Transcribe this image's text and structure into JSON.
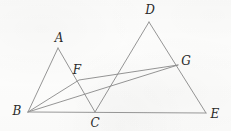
{
  "figure": {
    "stroke_color": "#8a8a8a",
    "baseline_color": "#9a9a9a",
    "label_color": "#2a2a2a",
    "background_color": "#fdfdfc",
    "width": 231,
    "height": 131,
    "points": [
      {
        "id": "A",
        "label": "A",
        "x": 58,
        "y": 48,
        "label_x": 59,
        "label_y": 38
      },
      {
        "id": "B",
        "label": "B",
        "x": 28,
        "y": 112,
        "label_x": 17,
        "label_y": 111
      },
      {
        "id": "C",
        "label": "C",
        "x": 95,
        "y": 112,
        "label_x": 95,
        "label_y": 123
      },
      {
        "id": "D",
        "label": "D",
        "x": 149,
        "y": 22,
        "label_x": 150,
        "label_y": 10
      },
      {
        "id": "E",
        "label": "E",
        "x": 206,
        "y": 113,
        "label_x": 215,
        "label_y": 114
      },
      {
        "id": "F",
        "label": "F",
        "x": 79,
        "y": 80,
        "label_x": 77,
        "label_y": 70
      },
      {
        "id": "G",
        "label": "G",
        "x": 178,
        "y": 65,
        "label_x": 186,
        "label_y": 61
      }
    ],
    "segments": [
      {
        "id": "seg-AB",
        "from": "B",
        "to": "A",
        "name": "segment-ab"
      },
      {
        "id": "seg-AC",
        "from": "A",
        "to": "C",
        "name": "segment-ac"
      },
      {
        "id": "seg-DC",
        "from": "D",
        "to": "C",
        "name": "segment-dc"
      },
      {
        "id": "seg-DE",
        "from": "D",
        "to": "E",
        "name": "segment-de"
      },
      {
        "id": "seg-BG",
        "from": "B",
        "to": "G",
        "name": "segment-bg"
      },
      {
        "id": "seg-BF",
        "from": "B",
        "to": "G",
        "name": "segment-bfg",
        "via": "F"
      },
      {
        "id": "seg-BE",
        "from": "B",
        "to": "E",
        "name": "segment-be-baseline",
        "baseline": true
      }
    ]
  }
}
